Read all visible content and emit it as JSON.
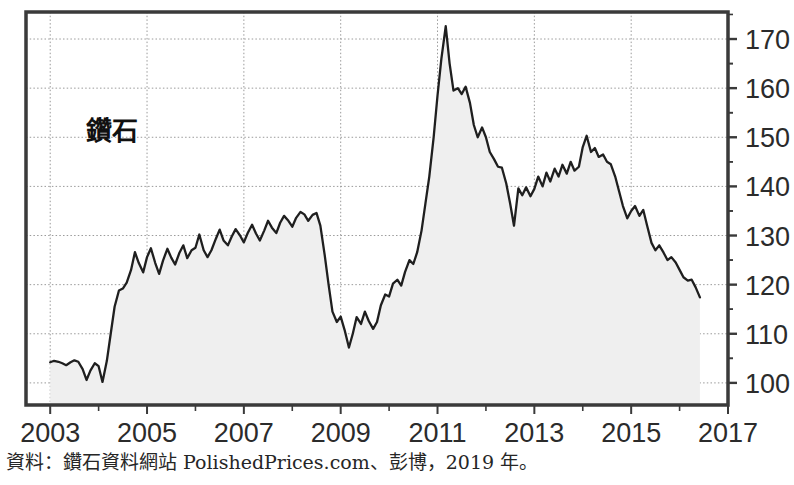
{
  "figure": {
    "series_label": "鑽石",
    "source_note": "資料：鑽石資料網站 PolishedPrices.com、彭博，2019 年。"
  },
  "chart_data": {
    "type": "area",
    "title": "鑽石",
    "subtitle": "",
    "xlabel": "",
    "ylabel": "",
    "xlim": [
      2002.5,
      2017.0
    ],
    "ylim": [
      95.5,
      175.5
    ],
    "grid": true,
    "legend": "none",
    "annotations": [
      "鑽石"
    ],
    "series_name": "鑽石",
    "line_color": "#1f1f1f",
    "fill_color": "#efefef",
    "x_tick_labels": [
      "2003",
      "2005",
      "2007",
      "2009",
      "2011",
      "2013",
      "2015",
      "2017"
    ],
    "x_tick_values": [
      2003,
      2005,
      2007,
      2009,
      2011,
      2013,
      2015,
      2017
    ],
    "x_minor_ticks": [
      2004,
      2006,
      2008,
      2010,
      2012,
      2014,
      2016
    ],
    "y_tick_labels": [
      "100",
      "110",
      "120",
      "130",
      "140",
      "150",
      "160",
      "170"
    ],
    "y_tick_values": [
      100,
      110,
      120,
      130,
      140,
      150,
      160,
      170
    ],
    "x": [
      2003.0,
      2003.08,
      2003.17,
      2003.25,
      2003.33,
      2003.42,
      2003.5,
      2003.58,
      2003.67,
      2003.75,
      2003.83,
      2003.92,
      2004.0,
      2004.08,
      2004.17,
      2004.25,
      2004.33,
      2004.42,
      2004.5,
      2004.58,
      2004.67,
      2004.75,
      2004.83,
      2004.92,
      2005.0,
      2005.08,
      2005.17,
      2005.25,
      2005.33,
      2005.42,
      2005.5,
      2005.58,
      2005.67,
      2005.75,
      2005.83,
      2005.92,
      2006.0,
      2006.08,
      2006.17,
      2006.25,
      2006.33,
      2006.42,
      2006.5,
      2006.58,
      2006.67,
      2006.75,
      2006.83,
      2006.92,
      2007.0,
      2007.08,
      2007.17,
      2007.25,
      2007.33,
      2007.42,
      2007.5,
      2007.58,
      2007.67,
      2007.75,
      2007.83,
      2007.92,
      2008.0,
      2008.08,
      2008.17,
      2008.25,
      2008.33,
      2008.42,
      2008.5,
      2008.58,
      2008.67,
      2008.75,
      2008.83,
      2008.92,
      2009.0,
      2009.08,
      2009.17,
      2009.25,
      2009.33,
      2009.42,
      2009.5,
      2009.58,
      2009.67,
      2009.75,
      2009.83,
      2009.92,
      2010.0,
      2010.08,
      2010.17,
      2010.25,
      2010.33,
      2010.42,
      2010.5,
      2010.58,
      2010.67,
      2010.75,
      2010.83,
      2010.92,
      2011.0,
      2011.08,
      2011.17,
      2011.25,
      2011.33,
      2011.42,
      2011.5,
      2011.58,
      2011.67,
      2011.75,
      2011.83,
      2011.92,
      2012.0,
      2012.08,
      2012.17,
      2012.25,
      2012.33,
      2012.42,
      2012.5,
      2012.58,
      2012.67,
      2012.75,
      2012.83,
      2012.92,
      2013.0,
      2013.08,
      2013.17,
      2013.25,
      2013.33,
      2013.42,
      2013.5,
      2013.58,
      2013.67,
      2013.75,
      2013.83,
      2013.92,
      2014.0,
      2014.08,
      2014.17,
      2014.25,
      2014.33,
      2014.42,
      2014.5,
      2014.58,
      2014.67,
      2014.75,
      2014.83,
      2014.92,
      2015.0,
      2015.08,
      2015.17,
      2015.25,
      2015.33,
      2015.42,
      2015.5,
      2015.58,
      2015.67,
      2015.75,
      2015.83,
      2015.92,
      2016.0,
      2016.08,
      2016.17,
      2016.25,
      2016.33,
      2016.42
    ],
    "values": [
      104.2,
      104.5,
      104.3,
      104.0,
      103.6,
      104.2,
      104.6,
      104.3,
      102.8,
      100.6,
      102.5,
      104.0,
      103.4,
      100.2,
      104.5,
      110.0,
      115.5,
      118.8,
      119.2,
      120.4,
      123.0,
      126.6,
      124.4,
      122.5,
      125.6,
      127.4,
      124.4,
      122.2,
      124.9,
      127.3,
      125.5,
      124.1,
      126.5,
      128.0,
      125.4,
      127.0,
      127.5,
      130.2,
      127.0,
      125.6,
      127.0,
      129.3,
      131.2,
      129.0,
      128.0,
      129.8,
      131.3,
      130.0,
      128.6,
      130.5,
      132.2,
      130.4,
      129.0,
      131.0,
      133.0,
      131.6,
      130.5,
      132.6,
      134.0,
      133.0,
      131.8,
      133.6,
      134.8,
      134.3,
      133.0,
      134.2,
      134.6,
      132.0,
      126.0,
      120.0,
      114.5,
      112.4,
      113.5,
      110.8,
      107.2,
      110.0,
      113.4,
      112.0,
      114.5,
      112.6,
      111.0,
      112.4,
      115.8,
      118.0,
      117.6,
      120.2,
      121.0,
      119.8,
      122.6,
      125.0,
      124.2,
      126.6,
      131.0,
      136.5,
      142.0,
      150.0,
      158.5,
      166.0,
      172.6,
      165.0,
      159.5,
      160.0,
      158.8,
      160.3,
      157.0,
      152.5,
      150.0,
      152.0,
      150.0,
      147.0,
      145.5,
      144.0,
      143.8,
      140.6,
      136.5,
      132.0,
      139.6,
      138.2,
      139.8,
      138.0,
      139.5,
      142.0,
      140.0,
      142.8,
      141.0,
      143.6,
      142.0,
      144.4,
      142.6,
      145.0,
      143.2,
      144.0,
      148.0,
      150.3,
      147.0,
      147.8,
      146.0,
      146.5,
      145.0,
      144.5,
      142.0,
      139.0,
      136.0,
      133.5,
      135.0,
      136.0,
      134.0,
      135.2,
      132.0,
      128.5,
      127.0,
      128.0,
      126.5,
      125.0,
      125.6,
      124.5,
      123.0,
      121.5,
      120.8,
      121.0,
      119.5,
      117.4
    ]
  }
}
